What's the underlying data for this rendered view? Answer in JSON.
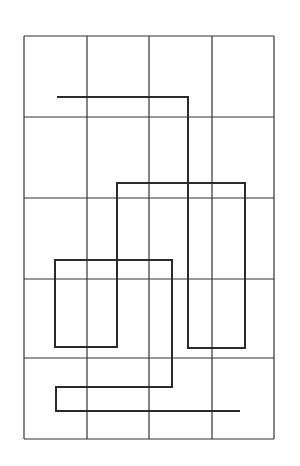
{
  "diagram": {
    "type": "grid-path-puzzle",
    "width": 300,
    "height": 466,
    "background": "#ffffff",
    "grid": {
      "columns": 4,
      "rows": 5,
      "x_lines": [
        24,
        87,
        149,
        212,
        274
      ],
      "y_lines": [
        36,
        117,
        198,
        279,
        358,
        439
      ],
      "stroke": "#333333",
      "stroke_width": 1.2
    },
    "path": {
      "stroke": "#2a2a2a",
      "stroke_width": 2,
      "points": [
        [
          57,
          97
        ],
        [
          188,
          97
        ],
        [
          188,
          348
        ],
        [
          245,
          348
        ],
        [
          245,
          183
        ],
        [
          117,
          183
        ],
        [
          117,
          347
        ],
        [
          55,
          347
        ],
        [
          55,
          260
        ],
        [
          172,
          260
        ],
        [
          172,
          387
        ],
        [
          56,
          387
        ],
        [
          56,
          411
        ],
        [
          240,
          411
        ]
      ]
    }
  }
}
